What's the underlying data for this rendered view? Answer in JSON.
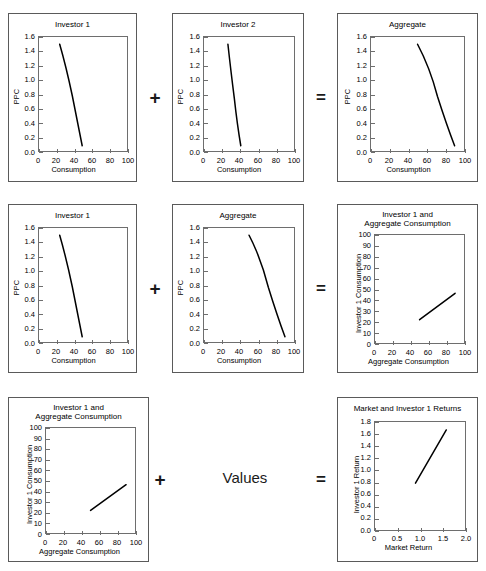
{
  "figure": {
    "top_caption": "",
    "operators": {
      "plus": "+",
      "equals": "="
    },
    "values_label": "Values"
  },
  "chart_data": [
    {
      "id": "investor1-ppc-row1",
      "type": "line",
      "title": "Investor 1",
      "xlabel": "Consumption",
      "ylabel": "PPC",
      "xlim": [
        0,
        100
      ],
      "ylim": [
        0.0,
        1.6
      ],
      "xticks": [
        "0",
        "20",
        "40",
        "60",
        "80",
        "100"
      ],
      "yticks": [
        "0.0",
        "0.2",
        "0.4",
        "0.6",
        "0.8",
        "1.0",
        "1.2",
        "1.4",
        "1.6"
      ],
      "grid": false,
      "legend": "none",
      "x": [
        23,
        26,
        29,
        33,
        37,
        41,
        44,
        48
      ],
      "y": [
        1.5,
        1.28,
        1.1,
        0.93,
        0.79,
        0.67,
        0.58,
        0.5
      ]
    },
    {
      "id": "investor2-ppc-row1",
      "type": "line",
      "title": "Investor 2",
      "xlabel": "Consumption",
      "ylabel": "PPC",
      "xlim": [
        0,
        100
      ],
      "ylim": [
        0.0,
        1.6
      ],
      "xticks": [
        "0",
        "20",
        "40",
        "60",
        "80",
        "100"
      ],
      "yticks": [
        "0.0",
        "0.2",
        "0.4",
        "0.6",
        "0.8",
        "1.0",
        "1.2",
        "1.4",
        "1.6"
      ],
      "grid": false,
      "legend": "none",
      "x": [
        26,
        27.5,
        29,
        31,
        33,
        35,
        37.5,
        40
      ],
      "y": [
        1.5,
        1.3,
        1.12,
        0.95,
        0.8,
        0.68,
        0.58,
        0.5
      ]
    },
    {
      "id": "aggregate-ppc-row1",
      "type": "line",
      "title": "Aggregate",
      "xlabel": "Consumption",
      "ylabel": "PPC",
      "xlim": [
        0,
        100
      ],
      "ylim": [
        0.0,
        1.6
      ],
      "xticks": [
        "0",
        "20",
        "40",
        "60",
        "80",
        "100"
      ],
      "yticks": [
        "0.0",
        "0.2",
        "0.4",
        "0.6",
        "0.8",
        "1.0",
        "1.2",
        "1.4",
        "1.6"
      ],
      "grid": false,
      "legend": "none",
      "x": [
        49,
        54,
        59,
        64,
        70,
        76,
        82,
        88
      ],
      "y": [
        1.5,
        1.29,
        1.11,
        0.95,
        0.8,
        0.68,
        0.58,
        0.5
      ]
    },
    {
      "id": "investor1-ppc-row2",
      "type": "line",
      "title": "Investor 1",
      "xlabel": "Consumption",
      "ylabel": "PPC",
      "xlim": [
        0,
        100
      ],
      "ylim": [
        0.0,
        1.6
      ],
      "xticks": [
        "0",
        "20",
        "40",
        "60",
        "80",
        "100"
      ],
      "yticks": [
        "0.0",
        "0.2",
        "0.4",
        "0.6",
        "0.8",
        "1.0",
        "1.2",
        "1.4",
        "1.6"
      ],
      "grid": false,
      "legend": "none",
      "x": [
        23,
        26,
        29,
        33,
        37,
        41,
        44,
        48
      ],
      "y": [
        1.5,
        1.28,
        1.1,
        0.93,
        0.79,
        0.67,
        0.58,
        0.5
      ]
    },
    {
      "id": "aggregate-ppc-row2",
      "type": "line",
      "title": "Aggregate",
      "xlabel": "Consumption",
      "ylabel": "PPC",
      "xlim": [
        0,
        100
      ],
      "ylim": [
        0.0,
        1.6
      ],
      "xticks": [
        "0",
        "20",
        "40",
        "60",
        "80",
        "100"
      ],
      "yticks": [
        "0.0",
        "0.2",
        "0.4",
        "0.6",
        "0.8",
        "1.0",
        "1.2",
        "1.4",
        "1.6"
      ],
      "grid": false,
      "legend": "none",
      "x": [
        49,
        54,
        59,
        64,
        70,
        76,
        82,
        88
      ],
      "y": [
        1.5,
        1.29,
        1.11,
        0.95,
        0.8,
        0.68,
        0.58,
        0.5
      ]
    },
    {
      "id": "investor1-vs-aggregate-row2",
      "type": "line",
      "title": "Investor 1 and\nAggregate Consumption",
      "xlabel": "Aggregate Consumption",
      "ylabel": "Investor 1 Consumption",
      "xlim": [
        0,
        100
      ],
      "ylim": [
        0,
        100
      ],
      "xticks": [
        "0",
        "20",
        "40",
        "60",
        "80",
        "100"
      ],
      "yticks": [
        "0",
        "10",
        "20",
        "30",
        "40",
        "50",
        "60",
        "70",
        "80",
        "90",
        "100"
      ],
      "grid": false,
      "legend": "none",
      "x": [
        49,
        88
      ],
      "y": [
        23,
        47
      ]
    },
    {
      "id": "investor1-vs-aggregate-row3",
      "type": "line",
      "title": "Investor 1 and\nAggregate Consumption",
      "xlabel": "Aggregate Consumption",
      "ylabel": "Investor 1 Consumption",
      "xlim": [
        0,
        100
      ],
      "ylim": [
        0,
        100
      ],
      "xticks": [
        "0",
        "20",
        "40",
        "60",
        "80",
        "100"
      ],
      "yticks": [
        "0",
        "10",
        "20",
        "30",
        "40",
        "50",
        "60",
        "70",
        "80",
        "90",
        "100"
      ],
      "grid": false,
      "legend": "none",
      "x": [
        49,
        88
      ],
      "y": [
        23,
        47
      ]
    },
    {
      "id": "market-vs-investor1-returns",
      "type": "line",
      "title": "Market and Investor 1 Returns",
      "xlabel": "Market Return",
      "ylabel": "Investor 1 Return",
      "xlim": [
        0,
        2.0
      ],
      "ylim": [
        0.0,
        1.8
      ],
      "xticks": [
        "0",
        "0.5",
        "1.0",
        "1.5",
        "2.0"
      ],
      "yticks": [
        "0.0",
        "0.2",
        "0.4",
        "0.6",
        "0.8",
        "1.0",
        "1.2",
        "1.4",
        "1.6",
        "1.8"
      ],
      "grid": false,
      "legend": "none",
      "x": [
        0.88,
        1.55
      ],
      "y": [
        0.8,
        1.67
      ]
    }
  ]
}
